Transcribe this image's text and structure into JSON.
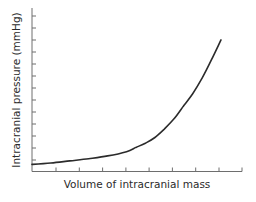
{
  "chart_data": {
    "type": "line",
    "title": "",
    "xlabel": "Volume of intracranial mass",
    "ylabel": "Intracranial pressure (mmHg)",
    "x_ticks": 9,
    "y_ticks": 14,
    "tick_labels": {
      "x": [],
      "y": []
    },
    "grid": false,
    "legend": null,
    "xlim": [
      0,
      1
    ],
    "ylim": [
      0,
      1
    ],
    "series": [
      {
        "name": "Pressure-volume curve",
        "description": "Exponential rise: flat initially (compensation), then steep increase",
        "x": [
          0.0,
          0.1,
          0.2,
          0.3,
          0.4,
          0.5,
          0.55,
          0.6,
          0.65,
          0.7,
          0.75,
          0.8,
          0.85,
          0.9,
          0.95,
          1.0
        ],
        "y": [
          0.05,
          0.06,
          0.075,
          0.09,
          0.11,
          0.14,
          0.17,
          0.2,
          0.24,
          0.3,
          0.37,
          0.46,
          0.55,
          0.66,
          0.79,
          0.93
        ]
      }
    ],
    "colors": {
      "line": "#2b2b2b",
      "axis": "#6e6e6e",
      "text": "#2b2b2b"
    }
  }
}
